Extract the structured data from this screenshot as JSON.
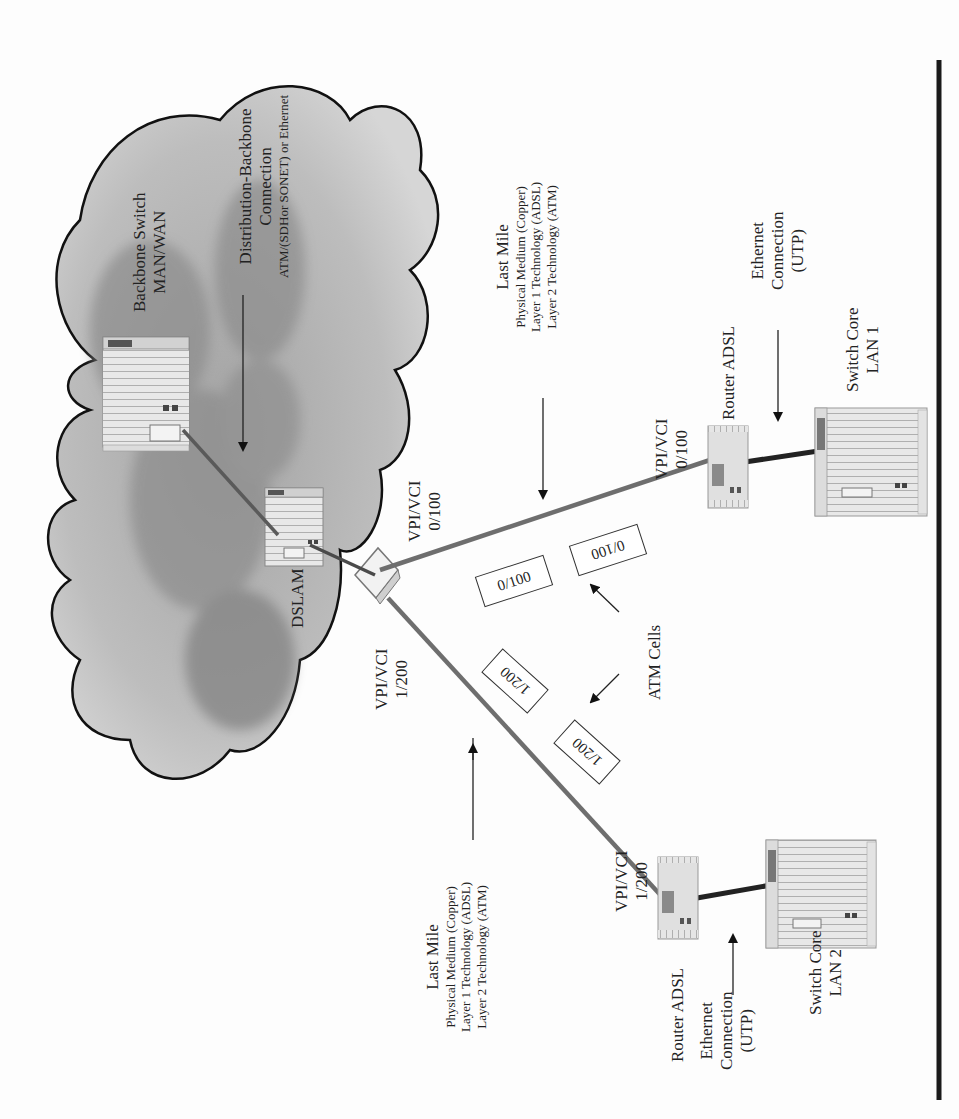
{
  "diagram": {
    "orientation": "rotated -90deg (text reads bottom-to-top)",
    "nodes": {
      "backbone_switch": {
        "line1": "Backbone Switch",
        "line2": "MAN/WAN"
      },
      "distribution_backbone": {
        "line1": "Distribution-Backbone",
        "line2": "Connection",
        "line3": "ATM/(SDHor SONET) or Ethernet"
      },
      "dslam": {
        "label": "DSLAM"
      },
      "vpi_top": {
        "line1": "VPI/VCI",
        "line2": "0/100"
      },
      "vpi_bottom": {
        "line1": "VPI/VCI",
        "line2": "1/200"
      },
      "last_mile_top": {
        "line1": "Last Mile",
        "line2": "Physical Medium (Copper)",
        "line3": "Layer 1 Technology (ADSL)",
        "line4": "Layer 2 Technology (ATM)"
      },
      "last_mile_bottom": {
        "line1": "Last Mile",
        "line2": "Physical Medium (Copper)",
        "line3": "Layer 1 Technology (ADSL)",
        "line4": "Layer 2 Technology (ATM)"
      },
      "router1": {
        "vpi_line1": "VPI/VCI",
        "vpi_line2": "0/100",
        "label": "Router ADSL"
      },
      "router2": {
        "vpi_line1": "VPI/VCI",
        "vpi_line2": "1/200",
        "label": "Router ADSL"
      },
      "ethernet_top": {
        "line1": "Ethernet",
        "line2": "Connection",
        "line3": "(UTP)"
      },
      "ethernet_bottom": {
        "line1": "Ethernet",
        "line2": "Connection",
        "line3": "(UTP)"
      },
      "switch_lan1": {
        "line1": "Switch Core",
        "line2": "LAN 1"
      },
      "switch_lan2": {
        "line1": "Switch Core",
        "line2": "LAN 2"
      },
      "atm_cells": {
        "label": "ATM Cells"
      }
    },
    "cells": {
      "top": [
        "0/100",
        "0/100"
      ],
      "bottom": [
        "1/200",
        "1/200"
      ]
    },
    "colors": {
      "cloud_fill": "#b9b9b9",
      "cloud_dark": "#8f8f8f",
      "link_gray": "#6e6e6e",
      "link_dark": "#2a2a2a",
      "rule": "#1a1a1a"
    }
  }
}
